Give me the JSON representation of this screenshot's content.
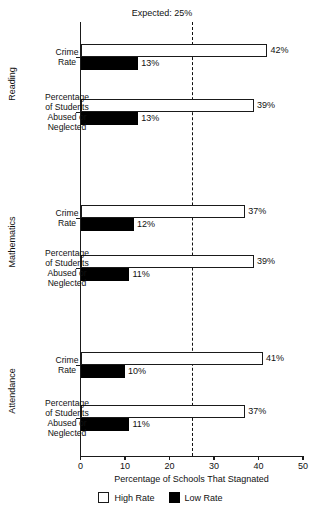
{
  "chart_data": {
    "type": "bar",
    "orientation": "horizontal",
    "title": "",
    "xlabel": "Percentage of Schools That Stagnated",
    "ylabel": "",
    "xlim": [
      0,
      50
    ],
    "xticks": [
      0,
      10,
      20,
      30,
      40,
      50
    ],
    "xtick_labels": [
      "0",
      "10",
      "20",
      "30",
      "40",
      "50"
    ],
    "grid": false,
    "legend": {
      "position": "bottom",
      "entries": [
        {
          "name": "High Rate",
          "color": "#ffffff"
        },
        {
          "name": "Low Rate",
          "color": "#000000"
        }
      ]
    },
    "annotations": [
      {
        "name": "expected-reference-line",
        "label": "Expected: 25%",
        "value": 25,
        "style": "dashed"
      }
    ],
    "groups": [
      {
        "name": "Reading",
        "categories": [
          {
            "label": "Crime\nRate",
            "label_lines": [
              "Crime",
              "Rate"
            ],
            "series": [
              {
                "name": "High Rate",
                "value": 42,
                "value_label": "42%"
              },
              {
                "name": "Low Rate",
                "value": 13,
                "value_label": "13%"
              }
            ]
          },
          {
            "label": "Percentage of Students Abused or Neglected",
            "label_lines": [
              "Percentage",
              "of Students",
              "Abused or",
              "Neglected"
            ],
            "series": [
              {
                "name": "High Rate",
                "value": 39,
                "value_label": "39%"
              },
              {
                "name": "Low Rate",
                "value": 13,
                "value_label": "13%"
              }
            ]
          }
        ]
      },
      {
        "name": "Mathematics",
        "categories": [
          {
            "label": "Crime Rate",
            "label_lines": [
              "Crime",
              "Rate"
            ],
            "series": [
              {
                "name": "High Rate",
                "value": 37,
                "value_label": "37%"
              },
              {
                "name": "Low Rate",
                "value": 12,
                "value_label": "12%"
              }
            ]
          },
          {
            "label": "Percentage of Students Abused or Neglected",
            "label_lines": [
              "Percentage",
              "of Students",
              "Abused or",
              "Neglected"
            ],
            "series": [
              {
                "name": "High Rate",
                "value": 39,
                "value_label": "39%"
              },
              {
                "name": "Low Rate",
                "value": 11,
                "value_label": "11%"
              }
            ]
          }
        ]
      },
      {
        "name": "Attendance",
        "categories": [
          {
            "label": "Crime Rate",
            "label_lines": [
              "Crime",
              "Rate"
            ],
            "series": [
              {
                "name": "High Rate",
                "value": 41,
                "value_label": "41%"
              },
              {
                "name": "Low Rate",
                "value": 10,
                "value_label": "10%"
              }
            ]
          },
          {
            "label": "Percentage of Students Abused or Neglected",
            "label_lines": [
              "Percentage",
              "of Students",
              "Abused or",
              "Neglected"
            ],
            "series": [
              {
                "name": "High Rate",
                "value": 37,
                "value_label": "37%"
              },
              {
                "name": "Low Rate",
                "value": 11,
                "value_label": "11%"
              }
            ]
          }
        ]
      }
    ]
  },
  "colors": {
    "axis": "#1a1a1a",
    "high_rate": "#ffffff",
    "low_rate": "#000000",
    "text": "#111111",
    "background": "#ffffff"
  }
}
